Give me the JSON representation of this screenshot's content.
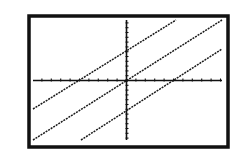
{
  "chart_data": {
    "type": "line",
    "title": "",
    "xlabel": "",
    "ylabel": "",
    "grid": false,
    "legend": null,
    "window": {
      "xmin": -10,
      "xmax": 10,
      "xscl": 1,
      "ymin": -13,
      "ymax": 13,
      "yscl": 1
    },
    "series": [
      {
        "name": "upper-line",
        "slope": 1.3,
        "y_intercept": 6.5,
        "x_intercept": -5
      },
      {
        "name": "middle-line",
        "slope": 1.3,
        "y_intercept": 0,
        "x_intercept": 0
      },
      {
        "name": "lower-line",
        "slope": 1.3,
        "y_intercept": -6.5,
        "x_intercept": 5
      }
    ]
  },
  "render": {
    "frame": {
      "x": 29,
      "y": 16,
      "w": 199,
      "h": 131
    },
    "origin": {
      "x": 126.5,
      "y": 80.5
    },
    "x_axis": {
      "x1": 33,
      "x2": 222
    },
    "y_axis": {
      "y1": 20,
      "y2": 140
    },
    "x_tick_px": 9.4,
    "y_tick_px": 4.8,
    "lines_px": [
      {
        "x1": 33,
        "y1": 109,
        "x2": 176,
        "y2": 20
      },
      {
        "x1": 33,
        "y1": 140,
        "x2": 222,
        "y2": 20
      },
      {
        "x1": 81,
        "y1": 140,
        "x2": 222,
        "y2": 49
      }
    ]
  }
}
